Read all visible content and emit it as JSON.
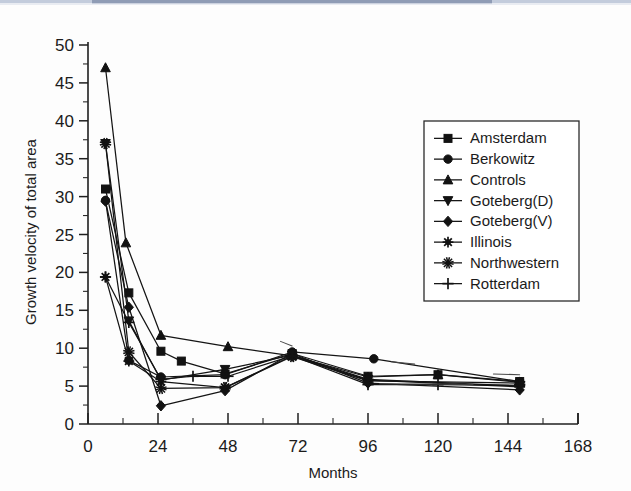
{
  "figure": {
    "background": "#ffffff",
    "ink_color": "#141414"
  },
  "chart_data": {
    "type": "line",
    "title": "",
    "subtitle": "",
    "xlabel": "Months",
    "ylabel": "Growth velocity of total area",
    "xlim": [
      0,
      168
    ],
    "ylim": [
      0,
      50
    ],
    "x_ticks": [
      0,
      24,
      48,
      72,
      96,
      120,
      144,
      168
    ],
    "x_tick_labels": [
      "0",
      "24",
      "48",
      "72",
      "96",
      "120",
      "144",
      "168"
    ],
    "x_minor_step": 12,
    "y_ticks": [
      0,
      5,
      10,
      15,
      20,
      25,
      30,
      35,
      40,
      45,
      50
    ],
    "y_tick_labels": [
      "0",
      "5",
      "10",
      "15",
      "20",
      "25",
      "30",
      "35",
      "40",
      "45",
      "50"
    ],
    "y_minor_step": 2.5,
    "grid": false,
    "legend_position": "right-upper",
    "legend_entries": [
      "Amsterdam",
      "Berkowitz",
      "Controls",
      "Goteberg(D)",
      "Goteberg(V)",
      "Illinois",
      "Northwestern",
      "Rotterdam"
    ],
    "series": [
      {
        "name": "Amsterdam",
        "marker": "square",
        "x": [
          6,
          14,
          25,
          32,
          47,
          70,
          96,
          120,
          148
        ],
        "y": [
          31.0,
          17.3,
          9.6,
          8.3,
          6.6,
          9.3,
          6.3,
          6.5,
          5.6
        ]
      },
      {
        "name": "Berkowitz",
        "marker": "circle",
        "x": [
          6,
          14,
          25,
          47,
          70,
          98,
          148
        ],
        "y": [
          29.5,
          8.4,
          6.2,
          6.5,
          9.5,
          8.6,
          5.6
        ]
      },
      {
        "name": "Controls",
        "marker": "triangle-up",
        "x": [
          6,
          13,
          25,
          48,
          70,
          96,
          120,
          148
        ],
        "y": [
          47.0,
          23.9,
          11.7,
          10.2,
          9.0,
          6.2,
          6.5,
          5.5
        ]
      },
      {
        "name": "Goteberg(D)",
        "marker": "triangle-down",
        "x": [
          6,
          14,
          25,
          47,
          70,
          96,
          148
        ],
        "y": [
          37.0,
          13.6,
          5.8,
          7.2,
          9.1,
          5.9,
          5.0
        ]
      },
      {
        "name": "Goteberg(V)",
        "marker": "diamond",
        "x": [
          6,
          14,
          25,
          47,
          70,
          96,
          148
        ],
        "y": [
          29.4,
          15.4,
          2.4,
          4.4,
          9.3,
          5.4,
          4.5
        ]
      },
      {
        "name": "Illinois",
        "marker": "star8",
        "x": [
          6,
          14,
          25,
          47,
          70,
          96,
          148
        ],
        "y": [
          19.4,
          8.3,
          5.6,
          4.8,
          9.0,
          5.8,
          4.9
        ]
      },
      {
        "name": "Northwestern",
        "marker": "asterisk",
        "x": [
          6,
          14,
          25,
          47,
          70,
          96,
          148
        ],
        "y": [
          37.0,
          9.5,
          4.7,
          4.8,
          8.9,
          5.7,
          5.4
        ]
      },
      {
        "name": "Rotterdam",
        "marker": "plus",
        "x": [
          6,
          14,
          25,
          36,
          48,
          70,
          96,
          120,
          148
        ],
        "y": [
          19.4,
          13.4,
          5.9,
          6.3,
          6.3,
          9.0,
          5.2,
          5.2,
          5.1
        ]
      }
    ]
  }
}
